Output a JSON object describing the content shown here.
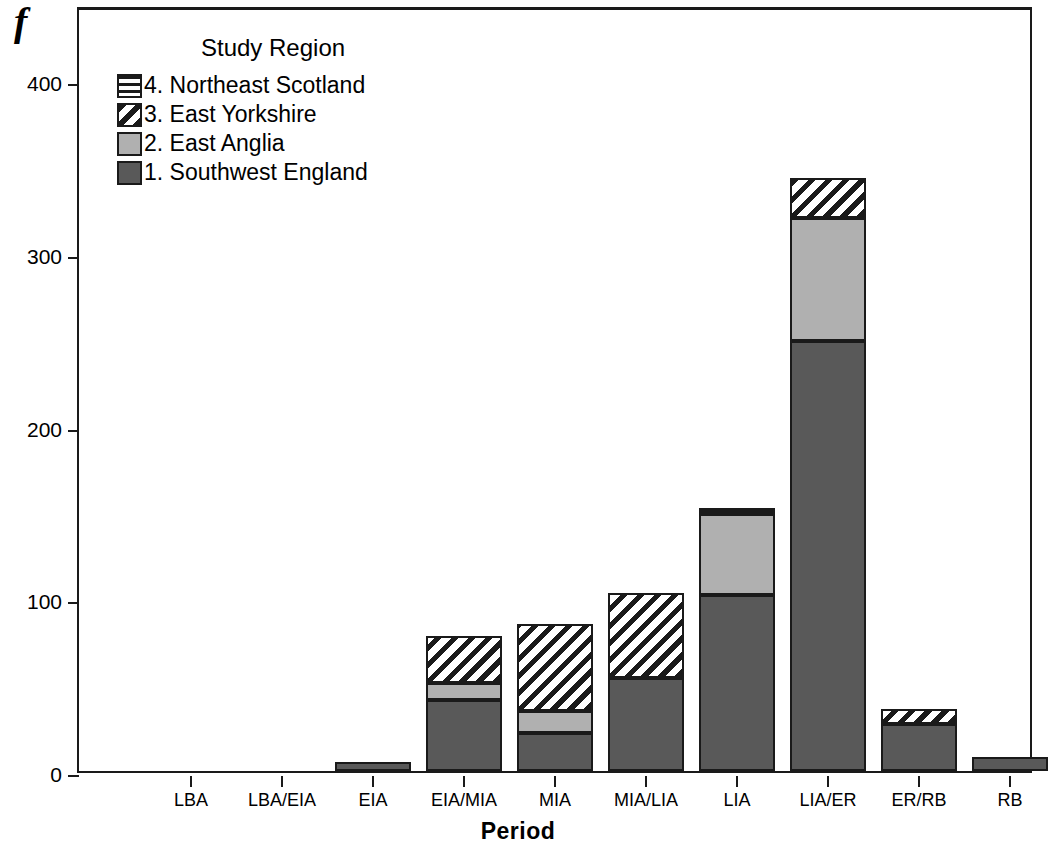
{
  "panel": {
    "letter": "f"
  },
  "legend": {
    "title": "Study Region",
    "entries": [
      {
        "label": "4. Northeast Scotland",
        "pattern": "horizontal-stripes",
        "swatch_name": "legend-swatch-northeast-scotland"
      },
      {
        "label": "3. East Yorkshire",
        "pattern": "diagonal-hatch",
        "swatch_name": "legend-swatch-east-yorkshire"
      },
      {
        "label": "2. East Anglia",
        "pattern": "solid-light-gray",
        "swatch_name": "legend-swatch-east-anglia"
      },
      {
        "label": "1. Southwest England",
        "pattern": "solid-dark-gray",
        "swatch_name": "legend-swatch-southwest-england"
      }
    ]
  },
  "axes": {
    "y_title": "Count",
    "x_title": "Period",
    "y_ticks": [
      "0",
      "100",
      "200",
      "300",
      "400"
    ]
  },
  "colors": {
    "dark_gray": "#595959",
    "light_gray": "#b0b0b0",
    "hatch_ink": "#1a1a1a",
    "background": "#ffffff"
  },
  "chart_data": {
    "type": "bar",
    "title": "",
    "subtitle": "",
    "xlabel": "Period",
    "ylabel": "Count",
    "legend_title": "Study Region",
    "legend_position": "inside-top-left",
    "grid": false,
    "stacked": true,
    "ylim": [
      0,
      430
    ],
    "yticks": [
      0,
      100,
      200,
      300,
      400
    ],
    "categories": [
      "LBA",
      "LBA/EIA",
      "EIA",
      "EIA/MIA",
      "MIA",
      "MIA/LIA",
      "LIA",
      "LIA/ER",
      "ER/RB",
      "RB"
    ],
    "series": [
      {
        "name": "1. Southwest England",
        "pattern": "solid-dark-gray",
        "values": [
          0,
          0,
          5,
          41,
          22,
          54,
          102,
          249,
          27,
          8
        ]
      },
      {
        "name": "2. East Anglia",
        "pattern": "solid-light-gray",
        "values": [
          0,
          0,
          0,
          10,
          13,
          0,
          47,
          71,
          0,
          0
        ]
      },
      {
        "name": "3. East Yorkshire",
        "pattern": "diagonal-hatch",
        "values": [
          0,
          0,
          0,
          27,
          50,
          49,
          0,
          23,
          9,
          0
        ]
      },
      {
        "name": "4. Northeast Scotland",
        "pattern": "horizontal-stripes",
        "values": [
          0,
          0,
          0,
          0,
          0,
          0,
          3,
          0,
          0,
          0
        ]
      }
    ],
    "totals": [
      0,
      0,
      5,
      78,
      85,
      103,
      152,
      343,
      36,
      8
    ]
  }
}
